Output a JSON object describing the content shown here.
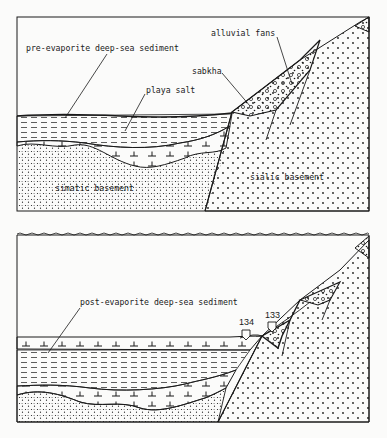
{
  "figure": {
    "panels": [
      {
        "id": "upper",
        "labels": {
          "pre_evaporite": "pre-evaporite deep-sea sediment",
          "playa_salt": "playa salt",
          "sabkha": "sabkha",
          "alluvial_fans": "alluvial fans",
          "simatic_basement": "simatic basement",
          "sialic_basement": "sialic basement"
        }
      },
      {
        "id": "lower",
        "labels": {
          "post_evaporite": "post-evaporite deep-sea sediment",
          "site_134": "134",
          "site_133": "133"
        }
      }
    ],
    "colors": {
      "ink": "#1a1a1a",
      "paper": "#fbfbfa"
    }
  }
}
